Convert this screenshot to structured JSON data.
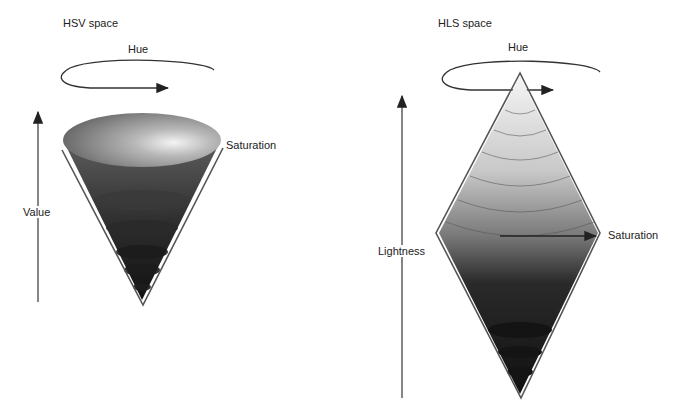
{
  "hsv": {
    "title": "HSV space",
    "hue_label": "Hue",
    "saturation_label": "Saturation",
    "value_label": "Value",
    "shape": "inverted-cone"
  },
  "hls": {
    "title": "HLS space",
    "hue_label": "Hue",
    "saturation_label": "Saturation",
    "lightness_label": "Lightness",
    "shape": "double-cone"
  },
  "colors": {
    "line": "#333333",
    "background": "#ffffff"
  }
}
